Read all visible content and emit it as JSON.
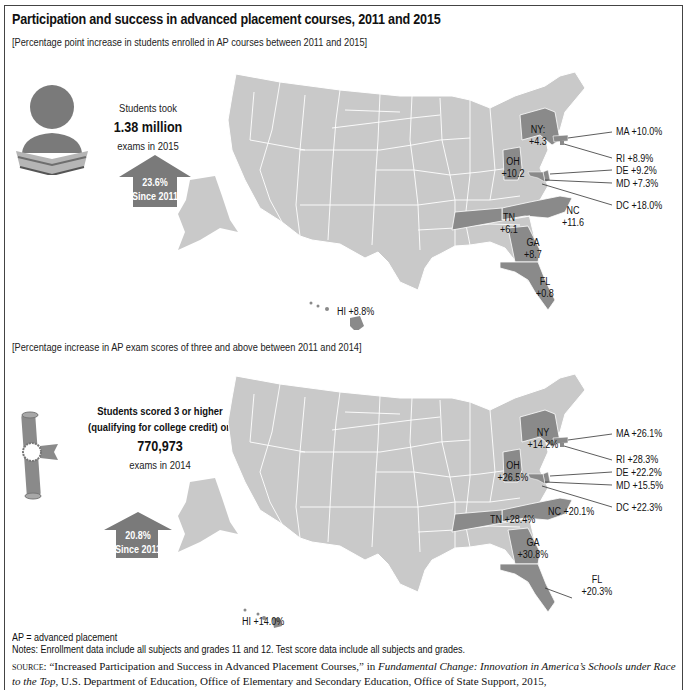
{
  "title": "Participation and success in advanced placement courses, 2011 and 2015",
  "colors": {
    "base_state": "#c9c9c9",
    "highlight_state": "#8a8a8a",
    "arrow": "#7a7a7a",
    "border": "#444444"
  },
  "panel1": {
    "subtitle": "[Percentage point increase in students enrolled in AP courses between 2011 and 2015]",
    "icon": "student-reading-book-icon",
    "stat_line1": "Students took",
    "stat_value": "1.38 million",
    "stat_line2": "exams in 2015",
    "arrow_pct": "23.6%",
    "arrow_since": "Since 2011",
    "states": [
      {
        "state": "NY",
        "label": "NY:",
        "value": "+4.3"
      },
      {
        "state": "MA",
        "label": "MA",
        "value": "+10.0%"
      },
      {
        "state": "RI",
        "label": "RI",
        "value": "+8.9%"
      },
      {
        "state": "DE",
        "label": "DE",
        "value": "+9.2%"
      },
      {
        "state": "MD",
        "label": "MD",
        "value": "+7.3%"
      },
      {
        "state": "DC",
        "label": "DC",
        "value": "+18.0%"
      },
      {
        "state": "OH",
        "label": "OH",
        "value": "+10.2"
      },
      {
        "state": "NC",
        "label": "NC",
        "value": "+11.6"
      },
      {
        "state": "TN",
        "label": "TN",
        "value": "+6.1"
      },
      {
        "state": "GA",
        "label": "GA",
        "value": "+8.7"
      },
      {
        "state": "FL",
        "label": "FL",
        "value": "+0.8"
      },
      {
        "state": "HI",
        "label": "HI",
        "value": "+8.8%"
      }
    ]
  },
  "panel2": {
    "subtitle": "[Percentage increase in AP exam scores of three and above between 2011 and 2014]",
    "icon": "diploma-scroll-icon",
    "stat_line1": "Students scored 3 or higher",
    "stat_line1b": "(qualifying for college credit) on",
    "stat_value": "770,973",
    "stat_line2": "exams in 2014",
    "arrow_pct": "20.8%",
    "arrow_since": "Since 2011",
    "states": [
      {
        "state": "NY",
        "label": "NY",
        "value": "+14.2%"
      },
      {
        "state": "MA",
        "label": "MA",
        "value": "+26.1%"
      },
      {
        "state": "RI",
        "label": "RI",
        "value": "+28.3%"
      },
      {
        "state": "DE",
        "label": "DE",
        "value": "+22.2%"
      },
      {
        "state": "MD",
        "label": "MD",
        "value": "+15.5%"
      },
      {
        "state": "DC",
        "label": "DC",
        "value": "+22.3%"
      },
      {
        "state": "OH",
        "label": "OH",
        "value": "+26.5%"
      },
      {
        "state": "TN",
        "label": "TN",
        "value": "+28.4%"
      },
      {
        "state": "NC",
        "label": "NC",
        "value": "+20.1%"
      },
      {
        "state": "GA",
        "label": "GA",
        "value": "+30.8%"
      },
      {
        "state": "FL",
        "label": "FL",
        "value": "+20.3%"
      },
      {
        "state": "HI",
        "label": "HI",
        "value": "+14.0%"
      }
    ]
  },
  "notes": {
    "abbrev": "AP = advanced placement",
    "text": "Notes: Enrollment data include all subjects and grades 11 and 12. Test score data include all subjects and grades."
  },
  "source": {
    "label": "source:",
    "part1": " “Increased Participation and Success in Advanced Placement Courses,” in ",
    "italic": "Fundamental Change: Innovation in America’s Schools under Race to the Top",
    "part2": ", U.S. Department of Education, Office of Elementary and Secondary Education, Office of State Support, 2015, https://www2.ed.gov/programs/"
  }
}
